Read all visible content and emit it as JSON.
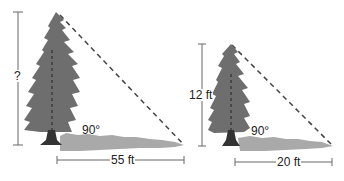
{
  "diagram": {
    "left_figure": {
      "height_label": "?",
      "shadow_label": "55 ft",
      "angle_label": "90°"
    },
    "right_figure": {
      "height_label": "12 ft",
      "shadow_label": "20 ft",
      "angle_label": "90°"
    },
    "colors": {
      "tree": "#6e6e6e",
      "shadow": "#a9a9a9",
      "trunk": "#333333",
      "lines": "#555555"
    }
  }
}
